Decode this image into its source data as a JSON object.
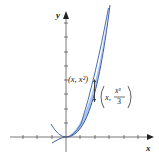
{
  "figure": {
    "axes": {
      "x_label": "x",
      "y_label": "y"
    },
    "curves": [
      {
        "name": "upper",
        "equation": "y = x^2"
      },
      {
        "name": "lower",
        "equation": "y = x^3/3"
      }
    ],
    "annotations": {
      "point_upper": "(x, x²)",
      "point_lower_prefix": "x,",
      "point_lower_num": "x³",
      "point_lower_den": "3"
    },
    "colors": {
      "fill": "#a9c6ea",
      "curve": "#3b5aa0",
      "axis": "#333333"
    }
  }
}
